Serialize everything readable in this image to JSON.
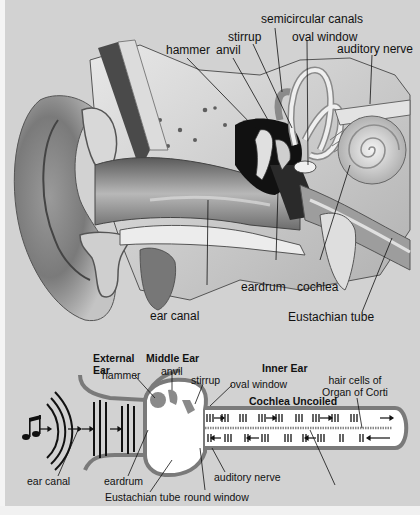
{
  "diagram": {
    "background_color": "#d2d2d2",
    "top_illustration": {
      "labels": [
        {
          "id": "semicircular-canals",
          "text": "semicircular canals"
        },
        {
          "id": "stirrup",
          "text": "stirrup"
        },
        {
          "id": "oval-window",
          "text": "oval window"
        },
        {
          "id": "hammer",
          "text": "hammer"
        },
        {
          "id": "anvil",
          "text": "anvil"
        },
        {
          "id": "auditory-nerve",
          "text": "auditory nerve"
        },
        {
          "id": "eardrum",
          "text": "eardrum"
        },
        {
          "id": "cochlea",
          "text": "cochlea"
        },
        {
          "id": "ear-canal",
          "text": "ear canal"
        },
        {
          "id": "eustachian-tube",
          "text": "Eustachian tube"
        }
      ]
    },
    "bottom_schematic": {
      "section_headers": [
        {
          "id": "external-ear",
          "text": "External\nEar",
          "line1": "External",
          "line2": "Ear"
        },
        {
          "id": "middle-ear",
          "text": "Middle Ear"
        },
        {
          "id": "inner-ear",
          "text": "Inner Ear"
        },
        {
          "id": "cochlea-uncoiled",
          "text": "Cochlea Uncoiled"
        }
      ],
      "labels": [
        {
          "id": "hammer",
          "text": "hammer"
        },
        {
          "id": "anvil",
          "text": "anvil"
        },
        {
          "id": "stirrup",
          "text": "stirrup"
        },
        {
          "id": "oval-window",
          "text": "oval window"
        },
        {
          "id": "hair-cells",
          "text": "hair cells of\nOrgan of Corti",
          "line1": "hair cells of",
          "line2": "Organ of Corti"
        },
        {
          "id": "ear-canal",
          "text": "ear canal"
        },
        {
          "id": "eardrum",
          "text": "eardrum"
        },
        {
          "id": "eustachian-tube",
          "text": "Eustachian tube"
        },
        {
          "id": "round-window",
          "text": "round window"
        },
        {
          "id": "auditory-nerve",
          "text": "auditory nerve"
        }
      ],
      "icons": [
        "music-note-icon",
        "sound-wave-icon",
        "arrow-icon"
      ]
    }
  }
}
